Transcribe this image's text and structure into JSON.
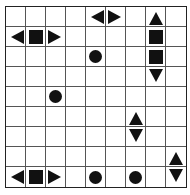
{
  "puzzle": {
    "type": "battleships",
    "rows": 9,
    "cols": 9,
    "colors": {
      "grid_line": "#555555",
      "border": "#222222",
      "piece": "#111111",
      "background": "#ffffff"
    },
    "pieces": [
      {
        "row": 0,
        "col": 4,
        "shape": "left"
      },
      {
        "row": 0,
        "col": 5,
        "shape": "right"
      },
      {
        "row": 0,
        "col": 7,
        "shape": "up"
      },
      {
        "row": 1,
        "col": 0,
        "shape": "left"
      },
      {
        "row": 1,
        "col": 1,
        "shape": "square"
      },
      {
        "row": 1,
        "col": 2,
        "shape": "right"
      },
      {
        "row": 1,
        "col": 7,
        "shape": "square"
      },
      {
        "row": 2,
        "col": 4,
        "shape": "circle"
      },
      {
        "row": 2,
        "col": 7,
        "shape": "square"
      },
      {
        "row": 3,
        "col": 7,
        "shape": "down"
      },
      {
        "row": 4,
        "col": 2,
        "shape": "circle"
      },
      {
        "row": 5,
        "col": 6,
        "shape": "up"
      },
      {
        "row": 6,
        "col": 6,
        "shape": "down"
      },
      {
        "row": 7,
        "col": 8,
        "shape": "up"
      },
      {
        "row": 8,
        "col": 0,
        "shape": "left"
      },
      {
        "row": 8,
        "col": 1,
        "shape": "square"
      },
      {
        "row": 8,
        "col": 2,
        "shape": "right"
      },
      {
        "row": 8,
        "col": 4,
        "shape": "circle"
      },
      {
        "row": 8,
        "col": 6,
        "shape": "circle"
      },
      {
        "row": 8,
        "col": 8,
        "shape": "down"
      }
    ]
  }
}
